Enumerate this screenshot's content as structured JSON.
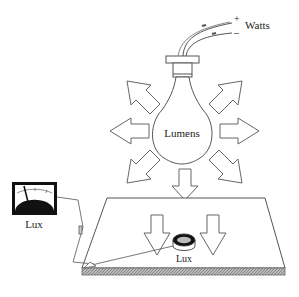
{
  "diagram": {
    "power_label": "Watts",
    "plus_sign": "+",
    "minus_sign": "–",
    "bulb_label": "Lumens",
    "meter_label": "Lux",
    "sensor_label": "Lux",
    "colors": {
      "stroke": "#555555",
      "text": "#222222",
      "meter_face": "#111111",
      "table_edge": "#888888"
    },
    "components": [
      {
        "name": "power-leads",
        "description": "Two wires labeled + and – leading to Watts"
      },
      {
        "name": "light-bulb",
        "description": "Incandescent bulb emitting light, labeled Lumens"
      },
      {
        "name": "radiating-arrows",
        "count": 8,
        "description": "Arrows pointing outward from bulb"
      },
      {
        "name": "work-surface",
        "description": "Flat table surface receiving light"
      },
      {
        "name": "surface-arrows",
        "count": 2,
        "description": "Downward arrows onto surface"
      },
      {
        "name": "lux-sensor",
        "description": "Photocell sensor on surface labeled Lux"
      },
      {
        "name": "lux-meter",
        "description": "Analog meter connected to sensor labeled Lux"
      }
    ]
  }
}
